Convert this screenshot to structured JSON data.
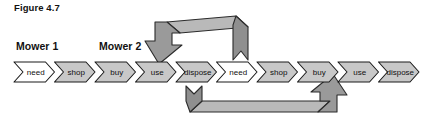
{
  "figure": {
    "title": "Figure 4.7",
    "caption_color": "#111111"
  },
  "groups": [
    {
      "label": "Mower 1"
    },
    {
      "label": "Mower 2"
    }
  ],
  "chain": {
    "stage_labels": [
      "need",
      "shop",
      "buy",
      "use",
      "dispose"
    ],
    "sequence": [
      {
        "label": "need",
        "group": 0,
        "fill": "#ffffff"
      },
      {
        "label": "shop",
        "group": 0,
        "fill": "#c8c8c8"
      },
      {
        "label": "buy",
        "group": 0,
        "fill": "#c8c8c8"
      },
      {
        "label": "use",
        "group": 0,
        "fill": "#c8c8c8"
      },
      {
        "label": "dispose",
        "group": 0,
        "fill": "#c8c8c8"
      },
      {
        "label": "need",
        "group": 1,
        "fill": "#ffffff"
      },
      {
        "label": "shop",
        "group": 1,
        "fill": "#c8c8c8"
      },
      {
        "label": "buy",
        "group": 1,
        "fill": "#c8c8c8"
      },
      {
        "label": "use",
        "group": 1,
        "fill": "#c8c8c8"
      },
      {
        "label": "dispose",
        "group": 1,
        "fill": "#c8c8c8"
      }
    ]
  },
  "feedback_arrows": [
    {
      "name": "top-feedback-arrow",
      "from": "dispose",
      "to": "use",
      "direction": "right-to-left",
      "head": "down"
    },
    {
      "name": "bottom-feedback-arrow",
      "from": "dispose",
      "to": "use",
      "direction": "left-to-right",
      "head": "up"
    }
  ],
  "colors": {
    "chevron_fill": "#c8c8c8",
    "chevron_fill_alt": "#ffffff",
    "chevron_stroke": "#1a1a1a",
    "arrow_face": "#9a9a9a",
    "arrow_top": "#b9b9b9",
    "arrow_shade": "#7c7c7c",
    "arrow_stroke": "#2b2b2b",
    "text": "#111111",
    "background": "#ffffff"
  }
}
